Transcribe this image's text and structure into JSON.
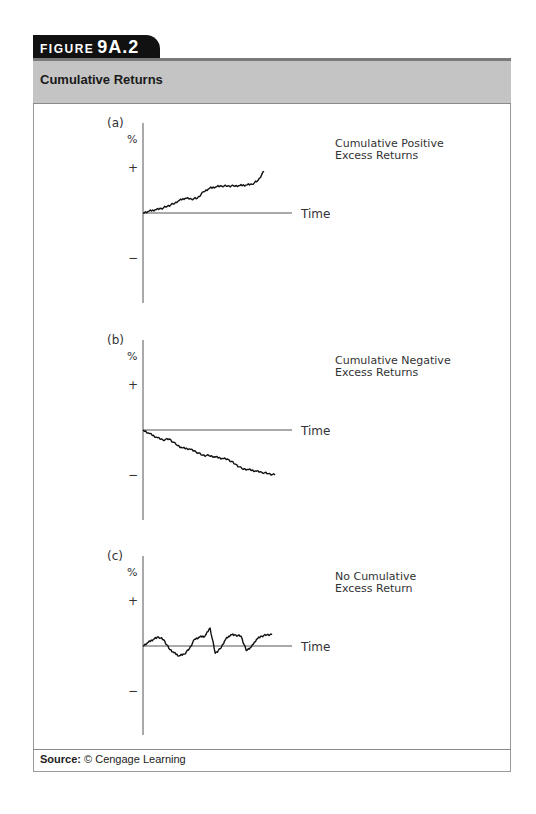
{
  "figure": {
    "tab_word": "FIGURE",
    "tab_number": "9A.2",
    "title": "Cumulative Returns",
    "source_label": "Source:",
    "source_text": "© Cengage Learning"
  },
  "colors": {
    "tab_bg": "#111111",
    "title_bar_bg": "#c4c4c4",
    "title_bar_top_strip": "#7a7a7a",
    "axis": "#555555",
    "curve": "#111111"
  },
  "chart_data": [
    {
      "type": "line",
      "panel": "(a)",
      "title": "Cumulative Positive Excess Returns",
      "title_lines": [
        "Cumulative Positive",
        "Excess Returns"
      ],
      "xlabel": "Time",
      "ylabel": "%",
      "yticks": [
        "+",
        "−"
      ],
      "ylim": [
        -1,
        1
      ],
      "grid": false,
      "x": [
        0,
        0.05,
        0.1,
        0.15,
        0.2,
        0.25,
        0.3,
        0.35,
        0.4,
        0.45,
        0.5,
        0.55,
        0.6,
        0.65,
        0.7,
        0.75,
        0.8,
        0.85,
        0.9,
        0.95,
        1.0
      ],
      "values": [
        0.0,
        0.04,
        0.07,
        0.1,
        0.15,
        0.2,
        0.28,
        0.33,
        0.31,
        0.33,
        0.47,
        0.55,
        0.58,
        0.6,
        0.6,
        0.6,
        0.61,
        0.62,
        0.64,
        0.72,
        0.93
      ]
    },
    {
      "type": "line",
      "panel": "(b)",
      "title": "Cumulative Negative Excess Returns",
      "title_lines": [
        "Cumulative Negative",
        "Excess Returns"
      ],
      "xlabel": "Time",
      "ylabel": "%",
      "yticks": [
        "+",
        "−"
      ],
      "ylim": [
        -1,
        1
      ],
      "grid": false,
      "x": [
        0,
        0.05,
        0.1,
        0.15,
        0.2,
        0.25,
        0.3,
        0.35,
        0.4,
        0.45,
        0.5,
        0.55,
        0.6,
        0.65,
        0.7,
        0.75,
        0.8,
        0.85,
        0.9,
        0.95,
        1.0
      ],
      "values": [
        0.0,
        -0.08,
        -0.16,
        -0.22,
        -0.2,
        -0.32,
        -0.4,
        -0.42,
        -0.48,
        -0.56,
        -0.57,
        -0.6,
        -0.63,
        -0.66,
        -0.76,
        -0.86,
        -0.88,
        -0.91,
        -0.94,
        -0.97,
        -1.0
      ]
    },
    {
      "type": "line",
      "panel": "(c)",
      "title": "No Cumulative Excess Return",
      "title_lines": [
        "No Cumulative",
        "Excess Return"
      ],
      "xlabel": "Time",
      "ylabel": "%",
      "yticks": [
        "+",
        "−"
      ],
      "ylim": [
        -1,
        1
      ],
      "grid": false,
      "x": [
        0,
        0.04,
        0.08,
        0.12,
        0.16,
        0.2,
        0.24,
        0.28,
        0.32,
        0.36,
        0.4,
        0.44,
        0.48,
        0.52,
        0.56,
        0.6,
        0.64,
        0.68,
        0.72,
        0.76,
        0.8,
        0.84,
        0.88,
        0.92,
        0.96,
        1.0
      ],
      "values": [
        0.0,
        0.08,
        0.15,
        0.2,
        0.14,
        -0.05,
        -0.15,
        -0.22,
        -0.18,
        -0.06,
        0.15,
        0.2,
        0.22,
        0.4,
        -0.16,
        -0.06,
        0.15,
        0.25,
        0.24,
        0.22,
        -0.1,
        -0.02,
        0.15,
        0.22,
        0.25,
        0.25
      ]
    }
  ],
  "layout": {
    "panels": [
      {
        "axis_x": 143,
        "axis_top": 123,
        "axis_bottom": 303,
        "zero_y": 213,
        "plus_y": 168,
        "minus_y": 258,
        "time_line_end": 292,
        "curve_end_x": 264
      },
      {
        "axis_x": 143,
        "axis_top": 340,
        "axis_bottom": 520,
        "zero_y": 430,
        "plus_y": 385,
        "minus_y": 475,
        "time_line_end": 292,
        "curve_end_x": 275
      },
      {
        "axis_x": 143,
        "axis_top": 556,
        "axis_bottom": 735,
        "zero_y": 646,
        "plus_y": 601,
        "minus_y": 691,
        "time_line_end": 292,
        "curve_end_x": 272
      }
    ]
  }
}
